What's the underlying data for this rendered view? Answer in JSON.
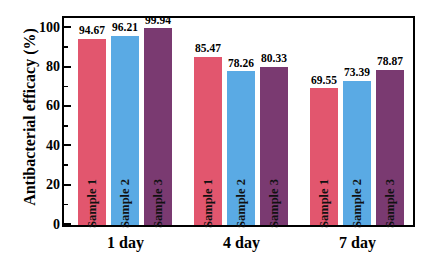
{
  "chart_data": {
    "type": "bar",
    "title": "",
    "xlabel": "",
    "ylabel": "Antibacterial efficacy (%)",
    "categories": [
      "1 day",
      "4 day",
      "7 day"
    ],
    "ylim": [
      0,
      100
    ],
    "yticks": [
      0,
      20,
      40,
      60,
      80,
      100
    ],
    "ytick_labels": [
      "0",
      "20",
      "40",
      "60",
      "80",
      "100"
    ],
    "grid": false,
    "legend_position": "none",
    "series": [
      {
        "name": "Sample 1",
        "color": "#e2566e",
        "values": [
          94.67,
          96.21,
          99.94
        ]
      },
      {
        "name": "Sample 2",
        "color": "#5aaae4",
        "values": [
          85.47,
          78.26,
          80.33
        ]
      },
      {
        "name": "Sample 3",
        "color": "#7a3a71",
        "values": [
          69.55,
          73.39,
          78.87
        ]
      }
    ],
    "bars": [
      {
        "group": "1 day",
        "series": "Sample 1",
        "value": 94.67,
        "label": "94.67",
        "color": "#e2566e"
      },
      {
        "group": "1 day",
        "series": "Sample 2",
        "value": 96.21,
        "label": "96.21",
        "color": "#5aaae4"
      },
      {
        "group": "1 day",
        "series": "Sample 3",
        "value": 99.94,
        "label": "99.94",
        "color": "#7a3a71"
      },
      {
        "group": "4 day",
        "series": "Sample 1",
        "value": 85.47,
        "label": "85.47",
        "color": "#e2566e"
      },
      {
        "group": "4 day",
        "series": "Sample 2",
        "value": 78.26,
        "label": "78.26",
        "color": "#5aaae4"
      },
      {
        "group": "4 day",
        "series": "Sample 3",
        "value": 80.33,
        "label": "80.33",
        "color": "#7a3a71"
      },
      {
        "group": "7 day",
        "series": "Sample 1",
        "value": 69.55,
        "label": "69.55",
        "color": "#e2566e"
      },
      {
        "group": "7 day",
        "series": "Sample 2",
        "value": 73.39,
        "label": "73.39",
        "color": "#5aaae4"
      },
      {
        "group": "7 day",
        "series": "Sample 3",
        "value": 78.87,
        "label": "78.87",
        "color": "#7a3a71"
      }
    ]
  },
  "axes": {
    "y_title": "Antibacterial efficacy (%)",
    "y_labels": [
      "100",
      "80",
      "60",
      "40",
      "20",
      "0"
    ],
    "x_labels": [
      "1 day",
      "4 day",
      "7 day"
    ]
  }
}
